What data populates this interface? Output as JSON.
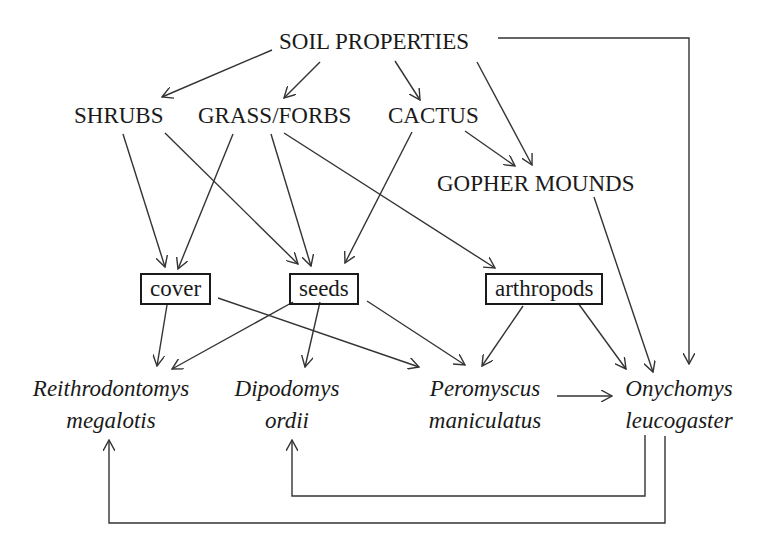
{
  "diagram": {
    "type": "food-web / causal path diagram",
    "colors": {
      "line": "#333333",
      "text": "#1a1a1a",
      "background": "#ffffff"
    },
    "nodes": {
      "soil": {
        "label": "SOIL PROPERTIES",
        "style": "caps"
      },
      "shrubs": {
        "label": "SHRUBS",
        "style": "caps"
      },
      "grass": {
        "label": "GRASS/FORBS",
        "style": "caps"
      },
      "cactus": {
        "label": "CACTUS",
        "style": "caps"
      },
      "gopher": {
        "label": "GOPHER MOUNDS",
        "style": "caps"
      },
      "cover": {
        "label": "cover",
        "style": "boxed"
      },
      "seeds": {
        "label": "seeds",
        "style": "boxed"
      },
      "arthropods": {
        "label": "arthropods",
        "style": "boxed"
      },
      "reithro": {
        "line1": "Reithrodontomys",
        "line2": "megalotis",
        "style": "italic"
      },
      "dipo": {
        "line1": "Dipodomys",
        "line2": "ordii",
        "style": "italic"
      },
      "pero": {
        "line1": "Peromyscus",
        "line2": "maniculatus",
        "style": "italic"
      },
      "onycho": {
        "line1": "Onychomys",
        "line2": "leucogaster",
        "style": "italic"
      }
    },
    "edges": [
      [
        "SOIL PROPERTIES",
        "SHRUBS"
      ],
      [
        "SOIL PROPERTIES",
        "GRASS/FORBS"
      ],
      [
        "SOIL PROPERTIES",
        "CACTUS"
      ],
      [
        "SOIL PROPERTIES",
        "GOPHER MOUNDS"
      ],
      [
        "SOIL PROPERTIES",
        "Onychomys leucogaster"
      ],
      [
        "SHRUBS",
        "cover"
      ],
      [
        "SHRUBS",
        "seeds"
      ],
      [
        "GRASS/FORBS",
        "cover"
      ],
      [
        "GRASS/FORBS",
        "seeds"
      ],
      [
        "GRASS/FORBS",
        "arthropods"
      ],
      [
        "CACTUS",
        "seeds"
      ],
      [
        "CACTUS",
        "GOPHER MOUNDS"
      ],
      [
        "GOPHER MOUNDS",
        "Onychomys leucogaster"
      ],
      [
        "cover",
        "Reithrodontomys megalotis"
      ],
      [
        "cover",
        "Peromyscus maniculatus"
      ],
      [
        "seeds",
        "Reithrodontomys megalotis"
      ],
      [
        "seeds",
        "Dipodomys ordii"
      ],
      [
        "seeds",
        "Peromyscus maniculatus"
      ],
      [
        "arthropods",
        "Peromyscus maniculatus"
      ],
      [
        "arthropods",
        "Onychomys leucogaster"
      ],
      [
        "Peromyscus maniculatus",
        "Onychomys leucogaster"
      ],
      [
        "Onychomys leucogaster",
        "Dipodomys ordii"
      ],
      [
        "Onychomys leucogaster",
        "Reithrodontomys megalotis"
      ]
    ]
  }
}
